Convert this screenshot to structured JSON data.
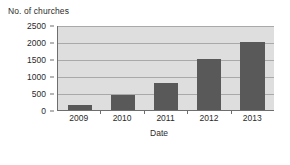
{
  "chart_data": {
    "type": "bar",
    "title": "",
    "categories": [
      "2009",
      "2010",
      "2011",
      "2012",
      "2013"
    ],
    "values": [
      150,
      450,
      800,
      1500,
      2000
    ],
    "xlabel": "Date",
    "ylabel": "No. of churches",
    "ylim": [
      0,
      2500
    ],
    "y_ticks": [
      0,
      500,
      1000,
      1500,
      2000,
      2500
    ],
    "y_tick_labels": [
      "0",
      "500",
      "1000",
      "1500",
      "2000",
      "2500"
    ],
    "grid": "horizontal",
    "legend": "none",
    "series": [
      {
        "name": "No. of churches",
        "values": [
          150,
          450,
          800,
          1500,
          2000
        ]
      }
    ],
    "colors": {
      "bar": "#595959",
      "plot_background": "#dedede",
      "gridline": "#a9a9a9",
      "axis": "#6e6e6e",
      "text": "#2b2b2b",
      "page_background": "#ffffff"
    }
  }
}
